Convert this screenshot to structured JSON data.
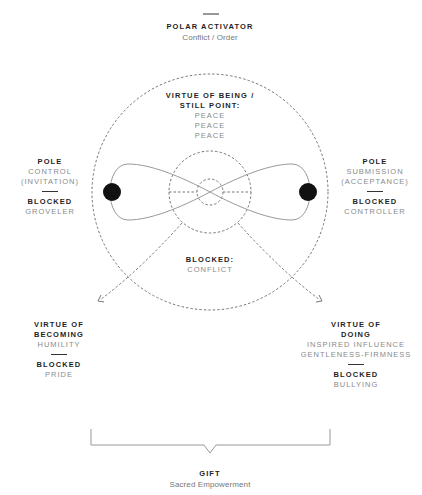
{
  "top": {
    "heading": "POLAR ACTIVATOR",
    "text": "Conflict / Order"
  },
  "center": {
    "heading_line1": "VIRTUE OF BEING /",
    "heading_line2": "STILL POINT:",
    "values": [
      "PEACE",
      "PEACE",
      "PEACE"
    ]
  },
  "left_pole": {
    "heading": "POLE",
    "line1": "CONTROL",
    "line2": "(INVITATION)",
    "blocked_heading": "BLOCKED",
    "blocked_value": "GROVELER"
  },
  "right_pole": {
    "heading": "POLE",
    "line1": "SUBMISSION",
    "line2": "(ACCEPTANCE)",
    "blocked_heading": "BLOCKED",
    "blocked_value": "CONTROLLER"
  },
  "bottom_center": {
    "heading": "BLOCKED:",
    "value": "CONFLICT"
  },
  "becoming": {
    "heading_line1": "VIRTUE OF",
    "heading_line2": "BECOMING",
    "value": "HUMILITY",
    "blocked_heading": "BLOCKED",
    "blocked_value": "PRIDE"
  },
  "doing": {
    "heading_line1": "VIRTUE OF",
    "heading_line2": "DOING",
    "value_line1": "INSPIRED INFLUENCE",
    "value_line2": "GENTLENESS-FIRMNESS",
    "blocked_heading": "BLOCKED",
    "blocked_value": "BULLYING"
  },
  "gift": {
    "heading": "GIFT",
    "text": "Sacred Empowerment"
  },
  "colors": {
    "line": "#8c8c8c",
    "dot": "#111111",
    "heading": "#1f1f1f",
    "text": "#8a8a8a"
  }
}
